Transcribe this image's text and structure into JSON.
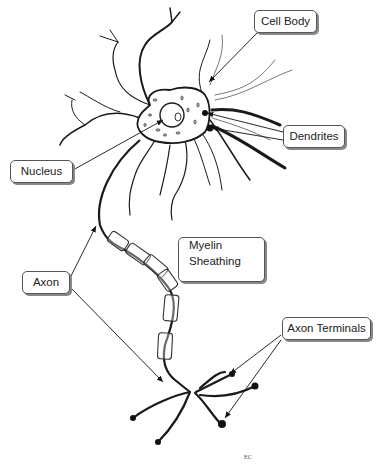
{
  "diagram": {
    "labels": {
      "cell_body": "Cell Body",
      "dendrites": "Dendrites",
      "nucleus": "Nucleus",
      "axon": "Axon",
      "myelin_line1": "Myelin",
      "myelin_line2": "Sheathing",
      "axon_terminals": "Axon Terminals"
    },
    "signature": "EC",
    "colors": {
      "ink": "#1a1a1a",
      "box_border": "#555555",
      "shadow": "#888888"
    }
  }
}
